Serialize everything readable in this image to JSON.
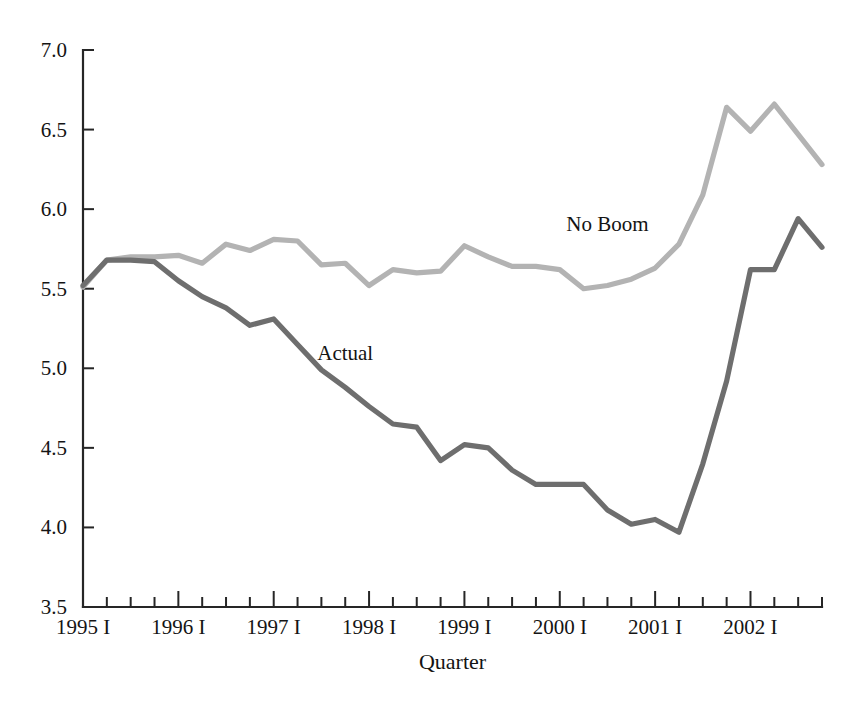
{
  "chart_data": {
    "type": "line",
    "title": "",
    "subtitle": "",
    "xlabel": "Quarter",
    "ylabel": "",
    "xlim": [
      0,
      31
    ],
    "ylim": [
      3.5,
      7.0
    ],
    "yticks": [
      "3.5",
      "4.0",
      "4.5",
      "5.0",
      "5.5",
      "6.0",
      "6.5",
      "7.0"
    ],
    "ytick_values": [
      3.5,
      4.0,
      4.5,
      5.0,
      5.5,
      6.0,
      6.5,
      7.0
    ],
    "xtick_labels": [
      "1995 I",
      "1996 I",
      "1997 I",
      "1998 I",
      "1999 I",
      "2000 I",
      "2001 I",
      "2002 I"
    ],
    "xtick_indices": [
      0,
      4,
      8,
      12,
      16,
      20,
      24,
      28
    ],
    "x": [
      "1995 I",
      "1995 II",
      "1995 III",
      "1995 IV",
      "1996 I",
      "1996 II",
      "1996 III",
      "1996 IV",
      "1997 I",
      "1997 II",
      "1997 III",
      "1997 IV",
      "1998 I",
      "1998 II",
      "1998 III",
      "1998 IV",
      "1999 I",
      "1999 II",
      "1999 III",
      "1999 IV",
      "2000 I",
      "2000 II",
      "2000 III",
      "2000 IV",
      "2001 I",
      "2001 II",
      "2001 III",
      "2001 IV",
      "2002 I",
      "2002 II",
      "2002 III",
      "2002 IV"
    ],
    "grid": false,
    "legend_position": "inline-annotation",
    "series": [
      {
        "name": "No Boom",
        "color": "#b3b3b3",
        "label_x_index": 22.0,
        "label_y_value": 5.86,
        "values": [
          5.51,
          5.68,
          5.7,
          5.7,
          5.71,
          5.66,
          5.78,
          5.74,
          5.81,
          5.8,
          5.65,
          5.66,
          5.52,
          5.62,
          5.6,
          5.61,
          5.77,
          5.7,
          5.64,
          5.64,
          5.62,
          5.5,
          5.52,
          5.56,
          5.63,
          5.78,
          6.09,
          6.64,
          6.49,
          6.66,
          6.47,
          6.28
        ]
      },
      {
        "name": "Actual",
        "color": "#6e6e6e",
        "label_x_index": 11.0,
        "label_y_value": 5.05,
        "values": [
          5.52,
          5.68,
          5.68,
          5.67,
          5.55,
          5.45,
          5.38,
          5.27,
          5.31,
          5.15,
          4.99,
          4.88,
          4.76,
          4.65,
          4.63,
          4.42,
          4.52,
          4.5,
          4.36,
          4.27,
          4.27,
          4.27,
          4.11,
          4.02,
          4.05,
          3.97,
          4.4,
          4.92,
          5.62,
          5.62,
          5.94,
          5.76
        ]
      }
    ]
  },
  "annotations": {
    "no_boom_label": "No Boom",
    "actual_label": "Actual"
  }
}
